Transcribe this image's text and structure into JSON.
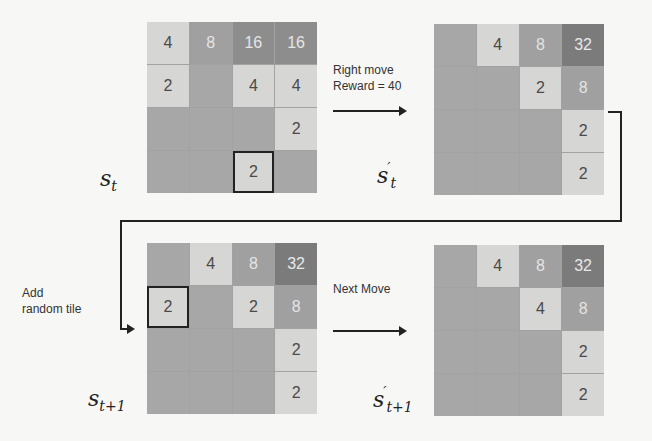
{
  "diagram": {
    "states": [
      {
        "id": "s_t",
        "label_base": "s",
        "label_sub": "t",
        "label_prime": "",
        "cells": [
          [
            4,
            8,
            16,
            16
          ],
          [
            2,
            0,
            4,
            4
          ],
          [
            0,
            0,
            0,
            2
          ],
          [
            0,
            0,
            2,
            0
          ]
        ],
        "highlight": [
          3,
          2
        ]
      },
      {
        "id": "s_t_prime",
        "label_base": "s",
        "label_sub": "t",
        "label_prime": "′",
        "cells": [
          [
            0,
            4,
            8,
            32
          ],
          [
            0,
            0,
            2,
            8
          ],
          [
            0,
            0,
            0,
            2
          ],
          [
            0,
            0,
            0,
            2
          ]
        ],
        "highlight": null
      },
      {
        "id": "s_t1",
        "label_base": "s",
        "label_sub": "t+1",
        "label_prime": "",
        "cells": [
          [
            0,
            4,
            8,
            32
          ],
          [
            2,
            0,
            2,
            8
          ],
          [
            0,
            0,
            0,
            2
          ],
          [
            0,
            0,
            0,
            2
          ]
        ],
        "highlight": [
          1,
          0
        ]
      },
      {
        "id": "s_t1_prime",
        "label_base": "s",
        "label_sub": "t+1",
        "label_prime": "′",
        "cells": [
          [
            0,
            4,
            8,
            32
          ],
          [
            0,
            0,
            4,
            8
          ],
          [
            0,
            0,
            0,
            2
          ],
          [
            0,
            0,
            0,
            2
          ]
        ],
        "highlight": null
      }
    ],
    "captions": {
      "right_move_line1": "Right move",
      "right_move_line2": "Reward = 40",
      "add_tile_line1": "Add",
      "add_tile_line2": "random tile",
      "next_move": "Next Move"
    },
    "colors": {
      "empty": "#a7a7a7",
      "low_tile": "#d6d6d4",
      "tile_8": "#a0a0a0",
      "tile_16": "#8d8d8d",
      "tile_32": "#7b7b7b",
      "arrow": "#222222"
    }
  }
}
